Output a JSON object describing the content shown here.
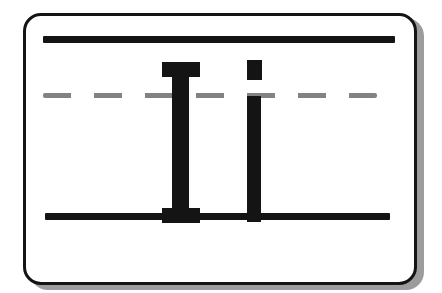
{
  "card": {
    "letters": {
      "uppercase": "I",
      "lowercase": "i"
    },
    "colors": {
      "page-bg": "#ffffff",
      "card-bg": "#ffffff",
      "ink": "#141414",
      "midline": "#828282",
      "shadow": "#9c9c9c"
    }
  }
}
